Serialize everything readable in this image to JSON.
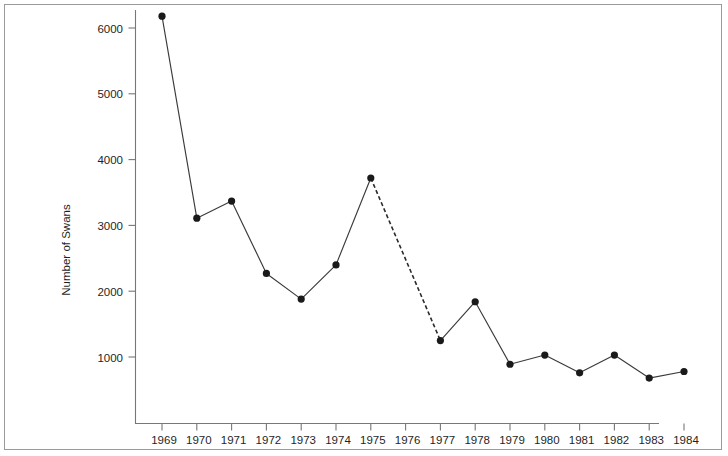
{
  "chart_data": {
    "type": "line",
    "title": "",
    "subtitle": "",
    "xlabel": "",
    "ylabel": "Number of Swans",
    "categories": [
      "1969",
      "1970",
      "1971",
      "1972",
      "1973",
      "1974",
      "1975",
      "1976",
      "1977",
      "1978",
      "1979",
      "1980",
      "1981",
      "1982",
      "1983",
      "1984"
    ],
    "x": [
      1969,
      1970,
      1971,
      1972,
      1973,
      1974,
      1975,
      1976,
      1977,
      1978,
      1979,
      1980,
      1981,
      1982,
      1983,
      1984
    ],
    "values": [
      6180,
      3110,
      3370,
      2270,
      1880,
      2400,
      3720,
      null,
      1250,
      1840,
      890,
      1030,
      760,
      1030,
      680,
      780
    ],
    "series": [
      {
        "name": "Number of Swans",
        "values": [
          6180,
          3110,
          3370,
          2270,
          1880,
          2400,
          3720,
          null,
          1250,
          1840,
          890,
          1030,
          760,
          1030,
          680,
          780
        ]
      }
    ],
    "xtick_labels": [
      "1969",
      "1970",
      "1971",
      "1972",
      "1973",
      "1974",
      "1975",
      "1976",
      "1977",
      "1978",
      "1979",
      "1980",
      "1981",
      "1982",
      "1983",
      "1984"
    ],
    "ytick_labels": [
      "1000",
      "2000",
      "3000",
      "4000",
      "5000",
      "6000"
    ],
    "ytick_values": [
      1000,
      2000,
      3000,
      4000,
      5000,
      6000
    ],
    "ylim": [
      0,
      6600
    ],
    "xlim": [
      1968.5,
      1984.5
    ],
    "grid": false,
    "legend": false,
    "legend_position": "none",
    "annotations": [
      {
        "text": "dashed segment between 1975 and 1977 (no data point at 1976)",
        "from_x": 1975,
        "to_x": 1977
      }
    ],
    "line_style": "solid-with-dashed-gap",
    "marker": "filled-circle",
    "colors": {
      "line": "#3b3b3b",
      "marker": "#1a1a1a",
      "axis": "#777777",
      "text": "#1f1f1f",
      "frame": "#9a9a9a",
      "background": "#ffffff"
    }
  }
}
